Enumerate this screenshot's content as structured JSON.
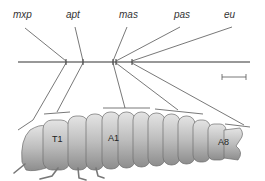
{
  "labels": {
    "top": [
      "mxp",
      "apt",
      "mas",
      "pas",
      "eu"
    ],
    "segments": [
      "T1",
      "A1",
      "A8"
    ]
  },
  "colors": {
    "line": "#444444",
    "body_light": "#d6d6d6",
    "body_dark": "#8a8a8a"
  }
}
